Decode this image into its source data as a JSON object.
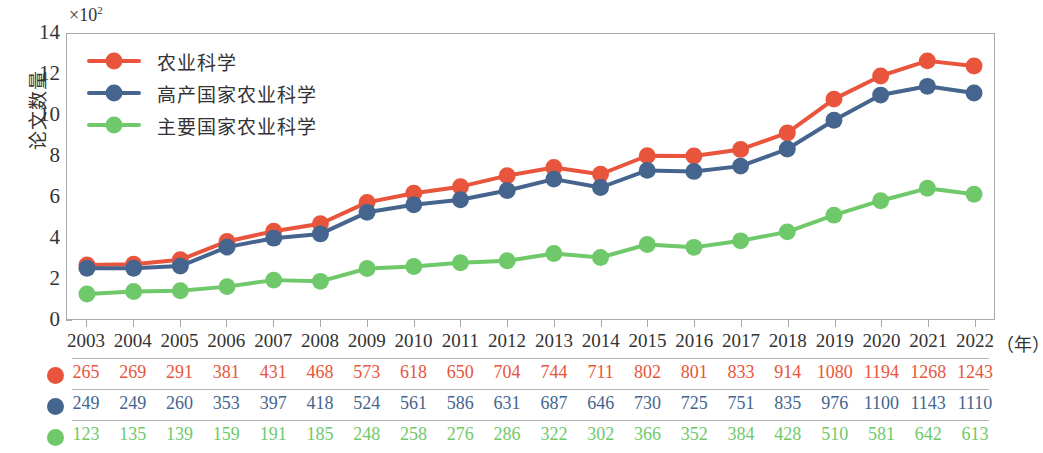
{
  "chart_data": {
    "type": "line",
    "title": "",
    "xlabel": "年",
    "ylabel": "论文数量",
    "y_multiplier": "×10",
    "y_multiplier_exponent": "2",
    "x": [
      "2003",
      "2004",
      "2005",
      "2006",
      "2007",
      "2008",
      "2009",
      "2010",
      "2011",
      "2012",
      "2013",
      "2014",
      "2015",
      "2016",
      "2017",
      "2018",
      "2019",
      "2020",
      "2021",
      "2022"
    ],
    "categories": [
      "2003",
      "2004",
      "2005",
      "2006",
      "2007",
      "2008",
      "2009",
      "2010",
      "2011",
      "2012",
      "2013",
      "2014",
      "2015",
      "2016",
      "2017",
      "2018",
      "2019",
      "2020",
      "2021",
      "2022"
    ],
    "series": [
      {
        "name": "农业科学",
        "color": "#E8553C",
        "values": [
          265,
          269,
          291,
          381,
          431,
          468,
          573,
          618,
          650,
          704,
          744,
          711,
          802,
          801,
          833,
          914,
          1080,
          1194,
          1268,
          1243
        ]
      },
      {
        "name": "高产国家农业科学",
        "color": "#45658F",
        "values": [
          249,
          249,
          260,
          353,
          397,
          418,
          524,
          561,
          586,
          631,
          687,
          646,
          730,
          725,
          751,
          835,
          976,
          1100,
          1143,
          1110
        ]
      },
      {
        "name": "主要国家农业科学",
        "color": "#6FC96A",
        "values": [
          123,
          135,
          139,
          159,
          191,
          185,
          248,
          258,
          276,
          286,
          322,
          302,
          366,
          352,
          384,
          428,
          510,
          581,
          642,
          613
        ]
      }
    ],
    "ylim": [
      0,
      1400
    ],
    "ytick_labels": [
      "0",
      "2",
      "4",
      "6",
      "8",
      "10",
      "12",
      "14"
    ],
    "ytick_values": [
      0,
      200,
      400,
      600,
      800,
      1000,
      1200,
      1400
    ],
    "grid": false,
    "legend_position": "top-left",
    "marker": "circle"
  },
  "axis": {
    "y_title": "论文数量",
    "x_unit": "（年）",
    "exp_prefix": "×10",
    "exp_sup": "2"
  },
  "legend": {
    "items": [
      {
        "label": "农业科学",
        "color": "#E8553C"
      },
      {
        "label": "高产国家农业科学",
        "color": "#45658F"
      },
      {
        "label": "主要国家农业科学",
        "color": "#6FC96A"
      }
    ]
  }
}
